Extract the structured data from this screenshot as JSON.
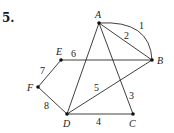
{
  "problem": {
    "number": "5."
  },
  "graph": {
    "vertices": [
      {
        "id": "A",
        "label": "A",
        "x": 99,
        "y": 23
      },
      {
        "id": "B",
        "label": "B",
        "x": 152,
        "y": 60
      },
      {
        "id": "C",
        "label": "C",
        "x": 133,
        "y": 114
      },
      {
        "id": "D",
        "label": "D",
        "x": 67,
        "y": 114
      },
      {
        "id": "E",
        "label": "E",
        "x": 61,
        "y": 60
      },
      {
        "id": "F",
        "label": "F",
        "x": 38,
        "y": 87
      }
    ],
    "edges": [
      {
        "label": "1",
        "from": "A",
        "to": "B",
        "curved": true
      },
      {
        "label": "2",
        "from": "A",
        "to": "B",
        "curved": false
      },
      {
        "label": "3",
        "from": "A",
        "to": "C"
      },
      {
        "label": "4",
        "from": "D",
        "to": "C"
      },
      {
        "label": "5",
        "from": "D",
        "to": "B"
      },
      {
        "label": "6",
        "from": "E",
        "to": "B"
      },
      {
        "label": "7",
        "from": "F",
        "to": "E"
      },
      {
        "label": "8",
        "from": "F",
        "to": "D"
      },
      {
        "label": "",
        "from": "A",
        "to": "D"
      }
    ]
  }
}
